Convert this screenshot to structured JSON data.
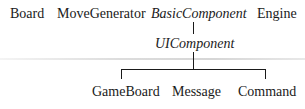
{
  "top_row": {
    "board": "Board",
    "move_generator": "MoveGenerator",
    "basic_component": "BasicComponent",
    "engine": "Engine"
  },
  "middle": {
    "ui_component": "UIComponent"
  },
  "children": [
    {
      "label": "GameBoard"
    },
    {
      "label": "Message"
    },
    {
      "label": "Command"
    }
  ]
}
